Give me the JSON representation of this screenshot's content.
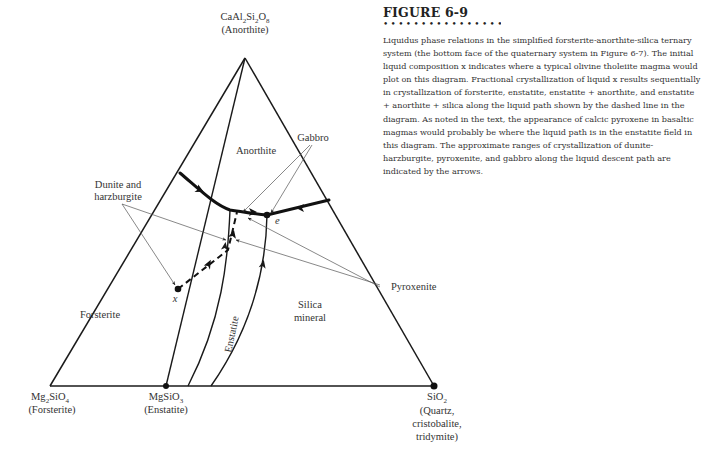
{
  "figure": {
    "title": "FIGURE 6-9",
    "dots": "••••••••••••••••••",
    "caption": "Liquidus phase relations in the simplified forsterite-anorthite-silica ternary system (the bottom face of the quaternary system in Figure 6-7). The initial liquid composition x indicates where a typical olivine tholeiite magma would plot on this diagram. Fractional crystallization of liquid x results sequentially in crystallization of forsterite, enstatite, enstatite + anorthite, and enstatite + anorthite + silica along the liquid path shown by the dashed line in the diagram. As noted in the text, the appearance of calcic pyroxene in basaltic magmas would probably be where the liquid path is in the enstatite field in this diagram. The approximate ranges of crystallization of dunite-harzburgite, pyroxenite, and gabbro along the liquid descent path are indicated by the arrows."
  },
  "diagram": {
    "vertices": {
      "top": {
        "formula_parts": [
          "CaAl",
          "2",
          "Si",
          "2",
          "O",
          "8"
        ],
        "name": "(Anorthite)"
      },
      "left": {
        "formula_parts": [
          "Mg",
          "2",
          "SiO",
          "4"
        ],
        "name": "(Forsterite)"
      },
      "middle": {
        "formula_parts": [
          "MgSiO",
          "3"
        ],
        "name": "(Enstatite)"
      },
      "right": {
        "formula_parts": [
          "SiO",
          "2"
        ],
        "name_lines": [
          "(Quartz,",
          "cristobalite,",
          "tridymite)"
        ]
      }
    },
    "fields": {
      "anorthite": "Anorthite",
      "forsterite": "Forsterite",
      "enstatite": "Enstatite",
      "silica_line1": "Silica",
      "silica_line2": "mineral"
    },
    "annotations": {
      "gabbro": "Gabbro",
      "dunite_line1": "Dunite and",
      "dunite_line2": "harzburgite",
      "pyroxenite": "Pyroxenite"
    },
    "points": {
      "x_label": "x",
      "e_label": "e"
    }
  }
}
